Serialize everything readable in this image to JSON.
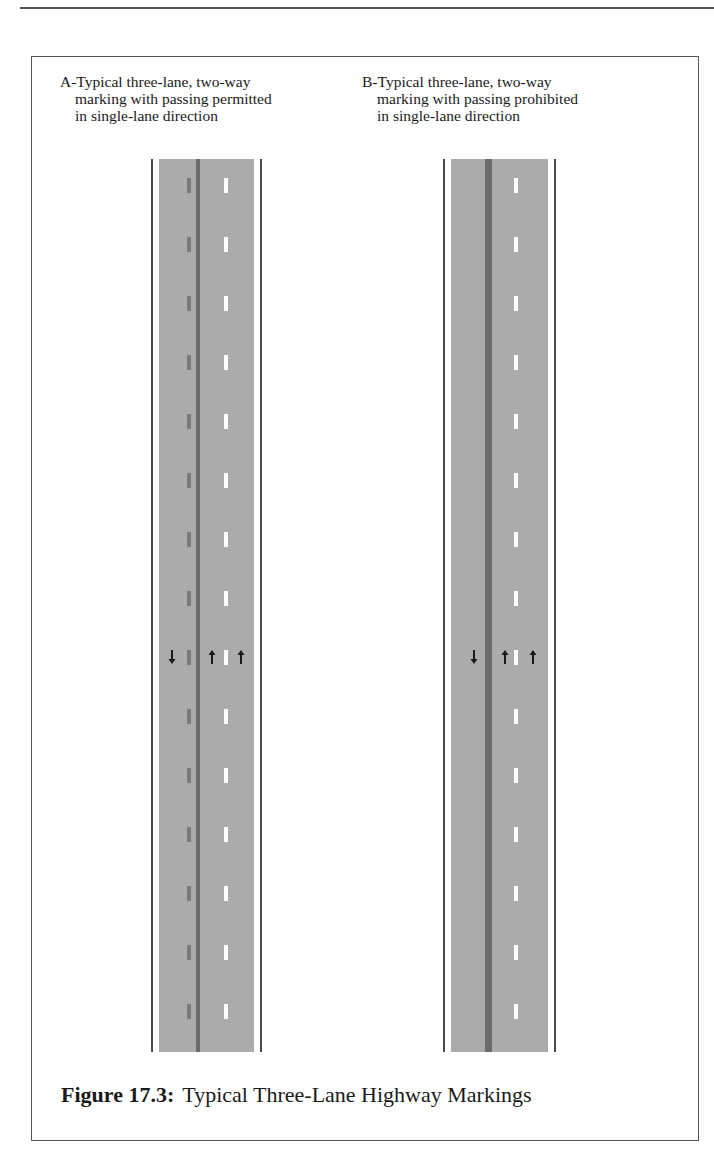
{
  "figure": {
    "number_label": "Figure 17.3:",
    "title": "Typical Three-Lane Highway Markings"
  },
  "panels": [
    {
      "id": "A",
      "label_line1": "A-Typical three-lane, two-way",
      "label_line2": "marking with passing permitted",
      "label_line3": "in single-lane direction",
      "passing": "permitted",
      "arrows": [
        "down",
        "up",
        "up"
      ]
    },
    {
      "id": "B",
      "label_line1": "B-Typical three-lane, two-way",
      "label_line2": "marking with passing prohibited",
      "label_line3": "in single-lane direction",
      "passing": "prohibited",
      "arrows": [
        "down",
        "up",
        "up"
      ]
    }
  ],
  "colors": {
    "pavement": "#ababab",
    "center_line": "#6b6b6b",
    "edge_line": "#ffffff",
    "outer_line": "#4a4a4a",
    "yellow_dash_gray": "#7a7a7a",
    "lane_dash": "#ffffff"
  }
}
